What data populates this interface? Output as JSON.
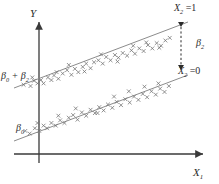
{
  "chart_data": {
    "type": "scatter",
    "title": "",
    "subtitle": "",
    "xlabel": "X",
    "xlabel_sub": "1",
    "ylabel": "Y",
    "grid": false,
    "legend": "none",
    "axis_style": "arrow-headed two-axis",
    "xlim": [
      0,
      10
    ],
    "ylim": [
      0,
      10
    ],
    "annotations": [
      {
        "name": "upper-line-label",
        "text": "X",
        "sub": "2",
        "rel": " =1"
      },
      {
        "name": "lower-line-label",
        "text": "X",
        "sub": "2",
        "rel": " =0"
      },
      {
        "name": "shift-label",
        "text": "β",
        "sub": "2",
        "rel": ""
      },
      {
        "name": "upper-intercept-label",
        "text": "β",
        "sub": "0",
        "rel": " + β"
      },
      {
        "name": "lower-intercept-label",
        "text": "β",
        "sub": "0",
        "rel": ""
      }
    ],
    "series": [
      {
        "name": "X2 = 1",
        "marker": "x",
        "line": {
          "intercept_label": "β0 + β2",
          "x0": -0.4,
          "y0": 5.15,
          "x1": 9.3,
          "y1": 9.05
        },
        "points_x": [
          0.55,
          0.95,
          1.15,
          1.35,
          1.55,
          1.7,
          1.95,
          2.15,
          2.3,
          2.55,
          2.8,
          3.05,
          3.3,
          3.5,
          3.7,
          3.95,
          4.15,
          4.4,
          4.6,
          4.85,
          5.1,
          5.3,
          5.55,
          5.8,
          6.0,
          6.25,
          6.5,
          6.75,
          6.95,
          7.2,
          7.45,
          7.7,
          7.95,
          8.2,
          8.45,
          8.7,
          8.95,
          1.05,
          2.45,
          3.15,
          4.05,
          5.0,
          5.95,
          6.85,
          7.6,
          8.35
        ],
        "points_y": [
          5.25,
          5.15,
          5.55,
          5.35,
          5.6,
          5.35,
          5.8,
          5.6,
          5.95,
          5.7,
          6.1,
          6.35,
          6.0,
          6.45,
          6.2,
          6.6,
          6.85,
          6.5,
          6.95,
          7.1,
          6.85,
          7.35,
          7.1,
          7.5,
          7.3,
          7.65,
          7.45,
          7.85,
          7.6,
          8.0,
          7.8,
          8.25,
          8.0,
          8.4,
          8.2,
          8.6,
          8.8,
          5.8,
          6.2,
          6.75,
          6.25,
          7.55,
          7.0,
          8.2,
          8.45,
          8.05
        ]
      },
      {
        "name": "X2 = 0",
        "marker": "x",
        "line": {
          "intercept_label": "β0",
          "x0": -0.4,
          "y0": 1.55,
          "x1": 9.3,
          "y1": 5.45
        },
        "points_x": [
          0.65,
          0.9,
          1.2,
          1.45,
          1.7,
          1.9,
          2.15,
          2.4,
          2.65,
          2.9,
          3.15,
          3.4,
          3.65,
          3.9,
          4.15,
          4.4,
          4.65,
          4.9,
          5.15,
          5.4,
          5.65,
          5.9,
          6.15,
          6.4,
          6.65,
          6.9,
          7.15,
          7.4,
          7.65,
          7.9,
          8.15,
          8.4,
          8.65,
          8.9,
          1.35,
          2.55,
          3.55,
          4.8,
          5.75,
          6.6,
          7.5,
          8.3
        ],
        "points_y": [
          1.75,
          1.55,
          1.95,
          1.75,
          2.15,
          1.95,
          2.35,
          2.15,
          2.55,
          2.35,
          2.75,
          2.95,
          2.6,
          3.15,
          2.9,
          3.35,
          3.1,
          3.55,
          3.3,
          3.75,
          3.5,
          3.95,
          3.7,
          4.15,
          3.9,
          4.35,
          4.1,
          4.55,
          4.3,
          4.75,
          4.5,
          4.95,
          4.7,
          5.15,
          2.35,
          2.9,
          3.45,
          3.1,
          4.35,
          4.75,
          5.1,
          5.35
        ]
      }
    ],
    "shift_arrow": {
      "label": "β2",
      "x": 8.75,
      "y_top": 8.85,
      "y_bottom": 5.1,
      "style": "dashed double-headed"
    }
  },
  "colors": {
    "axis": "#3a3a3a",
    "line": "#8c8c8c",
    "marker": "#6e6e6e",
    "text": "#2b2b2b",
    "background": "#ffffff"
  }
}
